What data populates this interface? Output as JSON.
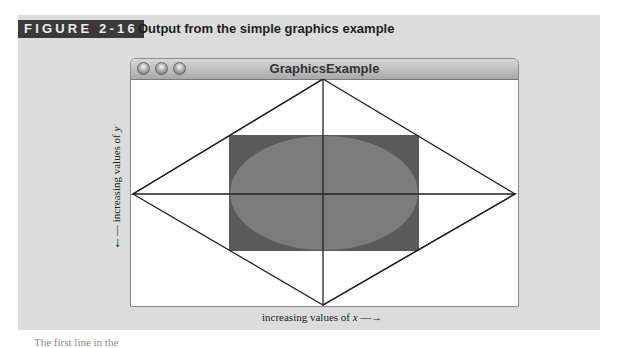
{
  "figure": {
    "label": "FIGURE 2-16",
    "title": "Output from the simple graphics example"
  },
  "window": {
    "title": "GraphicsExample",
    "buttons": [
      "close",
      "minimize",
      "zoom"
    ]
  },
  "canvas": {
    "shapes": [
      {
        "type": "diamond",
        "stroke": "#222222",
        "points": "top,left,right,bottom at window edges"
      },
      {
        "type": "filled-rect",
        "color": "#5a5a5a"
      },
      {
        "type": "filled-oval",
        "color": "#7c7c7c"
      }
    ]
  },
  "axes": {
    "y_label": "increasing values of",
    "y_var": "y",
    "x_label": "increasing values of",
    "x_var": "x"
  },
  "footer": {
    "text": "The first line in the"
  },
  "colors": {
    "band": "#dcdcdc",
    "label_bg": "#3a3a3a",
    "rect": "#5a5a5a",
    "oval": "#7c7c7c"
  }
}
